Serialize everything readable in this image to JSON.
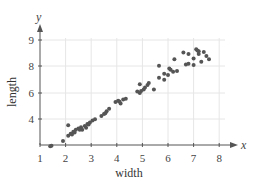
{
  "chart_data": {
    "type": "scatter",
    "title": "",
    "xlabel": "width",
    "ylabel": "length",
    "x_axis_var": "x",
    "y_axis_var": "y",
    "x_ticks": [
      "1",
      "2",
      "3",
      "4",
      "5",
      "6",
      "7",
      "8"
    ],
    "y_ticks": [
      "4",
      "6",
      "8",
      "9"
    ],
    "xlim": [
      1,
      8.6
    ],
    "ylim": [
      2,
      9.6
    ],
    "grid": true,
    "legend": null,
    "colors": {
      "points": "#555555",
      "grid": "#e6e6e6",
      "axis": "#555555"
    },
    "points": [
      {
        "x": 1.45,
        "y": 1.95
      },
      {
        "x": 1.4,
        "y": 1.9
      },
      {
        "x": 1.9,
        "y": 2.3
      },
      {
        "x": 2.1,
        "y": 3.5
      },
      {
        "x": 2.1,
        "y": 2.7
      },
      {
        "x": 2.2,
        "y": 2.85
      },
      {
        "x": 2.3,
        "y": 3.0
      },
      {
        "x": 2.4,
        "y": 3.15
      },
      {
        "x": 2.5,
        "y": 3.25
      },
      {
        "x": 2.6,
        "y": 3.35
      },
      {
        "x": 2.65,
        "y": 3.15
      },
      {
        "x": 2.75,
        "y": 3.45
      },
      {
        "x": 2.85,
        "y": 3.6
      },
      {
        "x": 2.95,
        "y": 3.7
      },
      {
        "x": 3.05,
        "y": 3.85
      },
      {
        "x": 3.15,
        "y": 3.95
      },
      {
        "x": 2.25,
        "y": 2.8
      },
      {
        "x": 2.35,
        "y": 2.95
      },
      {
        "x": 2.55,
        "y": 3.15
      },
      {
        "x": 2.8,
        "y": 3.3
      },
      {
        "x": 2.9,
        "y": 3.55
      },
      {
        "x": 3.4,
        "y": 4.2
      },
      {
        "x": 3.5,
        "y": 4.35
      },
      {
        "x": 3.6,
        "y": 4.55
      },
      {
        "x": 3.7,
        "y": 4.75
      },
      {
        "x": 3.55,
        "y": 4.4
      },
      {
        "x": 3.95,
        "y": 5.25
      },
      {
        "x": 4.05,
        "y": 5.35
      },
      {
        "x": 4.15,
        "y": 5.15
      },
      {
        "x": 4.25,
        "y": 5.45
      },
      {
        "x": 4.35,
        "y": 5.5
      },
      {
        "x": 4.1,
        "y": 5.3
      },
      {
        "x": 4.8,
        "y": 6.05
      },
      {
        "x": 4.9,
        "y": 5.95
      },
      {
        "x": 4.95,
        "y": 6.1
      },
      {
        "x": 5.05,
        "y": 6.2
      },
      {
        "x": 5.1,
        "y": 6.35
      },
      {
        "x": 5.2,
        "y": 6.55
      },
      {
        "x": 5.25,
        "y": 6.7
      },
      {
        "x": 5.45,
        "y": 6.2
      },
      {
        "x": 4.9,
        "y": 6.6
      },
      {
        "x": 5.65,
        "y": 7.1
      },
      {
        "x": 5.85,
        "y": 6.95
      },
      {
        "x": 6.0,
        "y": 7.3
      },
      {
        "x": 6.1,
        "y": 7.7
      },
      {
        "x": 6.2,
        "y": 7.55
      },
      {
        "x": 6.35,
        "y": 7.6
      },
      {
        "x": 5.65,
        "y": 8.0
      },
      {
        "x": 5.85,
        "y": 7.4
      },
      {
        "x": 6.05,
        "y": 7.8
      },
      {
        "x": 6.25,
        "y": 8.5
      },
      {
        "x": 6.6,
        "y": 9.0
      },
      {
        "x": 6.8,
        "y": 8.9
      },
      {
        "x": 6.7,
        "y": 8.1
      },
      {
        "x": 6.8,
        "y": 8.15
      },
      {
        "x": 7.0,
        "y": 8.55
      },
      {
        "x": 7.0,
        "y": 8.05
      },
      {
        "x": 7.1,
        "y": 9.25
      },
      {
        "x": 7.2,
        "y": 9.1
      },
      {
        "x": 7.2,
        "y": 8.9
      },
      {
        "x": 7.3,
        "y": 8.3
      },
      {
        "x": 7.4,
        "y": 9.05
      },
      {
        "x": 7.5,
        "y": 8.75
      },
      {
        "x": 7.6,
        "y": 8.5
      },
      {
        "x": 7.15,
        "y": 9.15
      }
    ]
  }
}
